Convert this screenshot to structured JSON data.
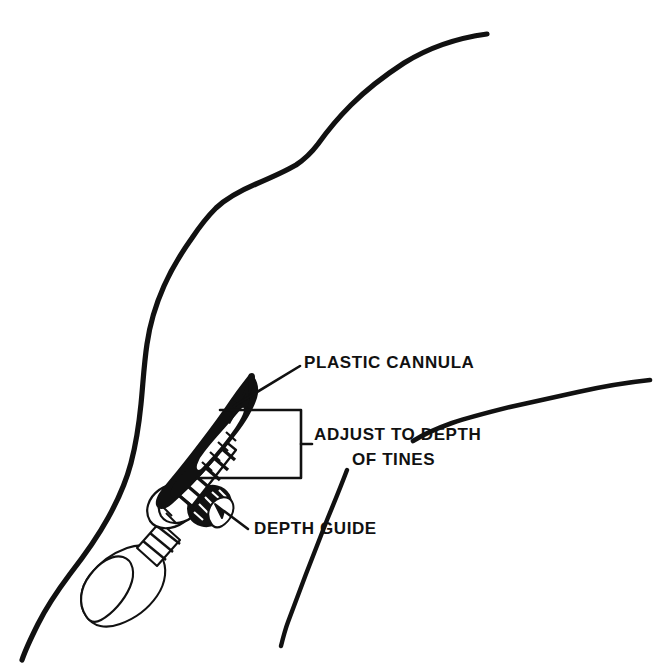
{
  "figure": {
    "background_color": "#ffffff",
    "ink_color": "#111111",
    "width": 664,
    "height": 664
  },
  "labels": {
    "plastic_cannula": "PLASTIC CANNULA",
    "adjust_to_depth": "ADJUST TO DEPTH",
    "of_tines": "OF TINES",
    "depth_guide": "DEPTH GUIDE"
  },
  "parts": {
    "skin_contour_main": "skin-contour-main",
    "skin_contour_upper_right": "skin-contour-upper-right",
    "skin_contour_lower_right": "skin-contour-lower-right",
    "cannula_sheath": "plastic-cannula-sheath",
    "tine_shaft": "ribbed-tine-shaft",
    "hub_collar": "hub-collar",
    "depth_guide_disc": "depth-guide-disc",
    "plunger_bulb": "plunger-bulb",
    "depth_bracket": "adjust-depth-bracket",
    "leader_cannula": "leader-line-plastic-cannula",
    "leader_depth_guide": "leader-line-depth-guide"
  }
}
